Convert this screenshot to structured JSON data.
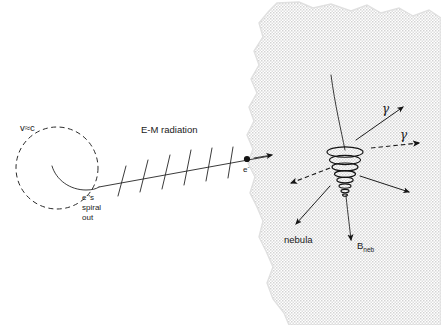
{
  "figure": {
    "domain": "Diagram",
    "background_color": "#ffffff",
    "ink_color": "#1d1d1d",
    "nebula_fill": "#e8e8e8",
    "width": 441,
    "height": 325
  },
  "labels": {
    "velocity": "v≈c",
    "electron_spiral": {
      "line1": "e",
      "superscript": "-",
      "line2": "'s",
      "line3": "spiral",
      "line4": "out"
    },
    "radiation": "E-M  radiation",
    "electron_particle": "e",
    "electron_particle_sup": "-",
    "gamma_upper": "γ",
    "gamma_lower": "γ",
    "nebula": "nebula",
    "magnetic_field": "B",
    "magnetic_field_sub": "neb"
  },
  "elements": {
    "dashed_circle": {
      "name": "electron-spiral-orbit",
      "cx": 57,
      "cy": 168,
      "r": 41,
      "style": "dashed"
    },
    "inner_spiral": {
      "name": "electron-path-spiral",
      "description": "solid curve spiraling outward from circle center"
    },
    "radiation_ray": {
      "name": "em-radiation-ray",
      "from_x": 98,
      "from_y": 185,
      "to_x": 268,
      "to_y": 156,
      "tick_count": 6,
      "description": "straight ray with six transverse wave tick marks"
    },
    "electron_dot": {
      "name": "electron-dot",
      "cx": 247,
      "cy": 159,
      "r": 3.1
    },
    "helix_cone": {
      "name": "helical-electron-trajectory",
      "cx": 345,
      "cy": 175,
      "top_y": 147,
      "bottom_y": 205,
      "turns": 7,
      "description": "cone-shaped helix narrowing downward"
    },
    "field_line": {
      "name": "magnetic-field-line",
      "description": "curved line descending from upper-left through helix to B_neb arrow"
    },
    "emission_arrows": [
      {
        "name": "emission-arrow-upper-left-gamma",
        "style": "solid",
        "angle_deg": -38
      },
      {
        "name": "emission-arrow-gamma-right",
        "style": "dashed",
        "angle_deg": -8
      },
      {
        "name": "emission-arrow-left",
        "style": "dashed",
        "angle_deg": 196
      },
      {
        "name": "emission-arrow-lower-left",
        "style": "solid",
        "angle_deg": 145
      },
      {
        "name": "emission-arrow-lower-right",
        "style": "solid",
        "angle_deg": 28
      }
    ]
  },
  "nebula_outline": "M 277 3 L 300 3 L 314 8 L 332 5 L 352 10 L 366 6 L 382 12 L 398 9 L 414 15 L 428 11 L 441 17 L 441 325 L 287 325 L 283 312 L 272 298 L 266 282 L 272 266 L 265 250 L 258 236 L 262 220 L 256 206 L 249 192 L 254 176 L 247 162 L 252 148 L 246 134 L 253 120 L 248 106 L 256 92 L 250 78 L 258 64 L 253 50 L 262 36 L 258 22 L 268 10 Z"
}
